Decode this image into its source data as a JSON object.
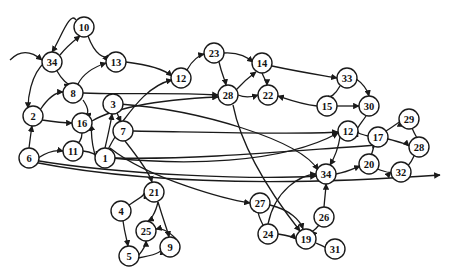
{
  "diagram": {
    "type": "directed-graph",
    "node_radius": 10,
    "colors": {
      "stroke": "#1a1a1a",
      "fill": "#ffffff",
      "background": "#ffffff"
    },
    "nodes": [
      {
        "id": "n10",
        "label": "10",
        "x": 84,
        "y": 27
      },
      {
        "id": "n34a",
        "label": "34",
        "x": 52,
        "y": 62
      },
      {
        "id": "n13",
        "label": "13",
        "x": 116,
        "y": 62
      },
      {
        "id": "n8",
        "label": "8",
        "x": 73,
        "y": 93
      },
      {
        "id": "n2",
        "label": "2",
        "x": 33,
        "y": 116
      },
      {
        "id": "n16",
        "label": "16",
        "x": 82,
        "y": 123
      },
      {
        "id": "n3",
        "label": "3",
        "x": 113,
        "y": 104
      },
      {
        "id": "n7",
        "label": "7",
        "x": 123,
        "y": 131
      },
      {
        "id": "n11",
        "label": "11",
        "x": 73,
        "y": 151
      },
      {
        "id": "n1",
        "label": "1",
        "x": 105,
        "y": 158
      },
      {
        "id": "n6",
        "label": "6",
        "x": 29,
        "y": 158
      },
      {
        "id": "n12a",
        "label": "12",
        "x": 181,
        "y": 78
      },
      {
        "id": "n23",
        "label": "23",
        "x": 214,
        "y": 53
      },
      {
        "id": "n28a",
        "label": "28",
        "x": 228,
        "y": 95
      },
      {
        "id": "n14",
        "label": "14",
        "x": 262,
        "y": 63
      },
      {
        "id": "n22",
        "label": "22",
        "x": 268,
        "y": 95
      },
      {
        "id": "n33",
        "label": "33",
        "x": 347,
        "y": 78
      },
      {
        "id": "n15",
        "label": "15",
        "x": 327,
        "y": 106
      },
      {
        "id": "n30",
        "label": "30",
        "x": 369,
        "y": 106
      },
      {
        "id": "n12b",
        "label": "12",
        "x": 348,
        "y": 131
      },
      {
        "id": "n17",
        "label": "17",
        "x": 378,
        "y": 137
      },
      {
        "id": "n29",
        "label": "29",
        "x": 409,
        "y": 119
      },
      {
        "id": "n28b",
        "label": "28",
        "x": 419,
        "y": 147
      },
      {
        "id": "n20",
        "label": "20",
        "x": 369,
        "y": 164
      },
      {
        "id": "n32",
        "label": "32",
        "x": 401,
        "y": 172
      },
      {
        "id": "n34b",
        "label": "34",
        "x": 326,
        "y": 174
      },
      {
        "id": "n21",
        "label": "21",
        "x": 154,
        "y": 192
      },
      {
        "id": "n4",
        "label": "4",
        "x": 121,
        "y": 211
      },
      {
        "id": "n25",
        "label": "25",
        "x": 146,
        "y": 231
      },
      {
        "id": "n9",
        "label": "9",
        "x": 170,
        "y": 247
      },
      {
        "id": "n5",
        "label": "5",
        "x": 129,
        "y": 256
      },
      {
        "id": "n27",
        "label": "27",
        "x": 260,
        "y": 203
      },
      {
        "id": "n24",
        "label": "24",
        "x": 268,
        "y": 234
      },
      {
        "id": "n19",
        "label": "19",
        "x": 306,
        "y": 239
      },
      {
        "id": "n26",
        "label": "26",
        "x": 324,
        "y": 217
      },
      {
        "id": "n31",
        "label": "31",
        "x": 335,
        "y": 249
      }
    ],
    "edges": [
      {
        "d": "M76,20 C70,10 60,40 52,52"
      },
      {
        "d": "M60,55 C68,45 75,40 80,36"
      },
      {
        "d": "M88,36 C95,55 105,60 108,55"
      },
      {
        "d": "M57,71 C62,80 68,85 70,84"
      },
      {
        "d": "M45,62 C30,75 28,100 28,108"
      },
      {
        "d": "M40,110 C50,95 58,92 63,92"
      },
      {
        "d": "M42,120 C55,122 65,123 72,123"
      },
      {
        "d": "M29,148 C30,140 31,132 32,126"
      },
      {
        "d": "M38,158 C50,150 58,150 63,151"
      },
      {
        "d": "M83,93 C120,95 160,92 218,95"
      },
      {
        "d": "M78,84 C85,70 100,65 106,63"
      },
      {
        "d": "M126,62 C150,65 165,70 172,76"
      },
      {
        "d": "M83,100 C90,110 88,115 85,114"
      },
      {
        "d": "M82,133 C82,140 78,145 76,142"
      },
      {
        "d": "M83,151 C92,152 97,155 96,157"
      },
      {
        "d": "M96,158 C90,140 92,130 91,125"
      },
      {
        "d": "M105,148 C108,135 111,122 112,114"
      },
      {
        "d": "M115,137 C110,145 108,150 108,149"
      },
      {
        "d": "M117,113 C120,120 121,122 121,122"
      },
      {
        "d": "M123,121 C135,105 150,85 172,80"
      },
      {
        "d": "M92,121 C110,110 150,100 218,97"
      },
      {
        "d": "M187,70 C192,60 200,55 204,54"
      },
      {
        "d": "M219,62 C222,75 225,80 226,85"
      },
      {
        "d": "M224,53 C240,52 248,58 253,62"
      },
      {
        "d": "M238,95 C245,98 252,97 258,95"
      },
      {
        "d": "M236,90 C245,80 252,75 256,72"
      },
      {
        "d": "M272,66 C300,72 320,75 337,78"
      },
      {
        "d": "M262,73 C265,80 267,83 267,85"
      },
      {
        "d": "M317,106 C300,104 290,100 278,96"
      },
      {
        "d": "M337,106 C348,106 355,106 359,106"
      },
      {
        "d": "M355,78 C365,85 368,92 369,96"
      },
      {
        "d": "M340,86 C335,95 330,98 328,96"
      },
      {
        "d": "M366,116 C360,125 355,130 358,131"
      },
      {
        "d": "M368,136 C360,134 357,133 358,131"
      },
      {
        "d": "M386,131 C395,125 400,122 400,121"
      },
      {
        "d": "M412,128 C415,135 417,138 417,137"
      },
      {
        "d": "M388,139 C400,142 408,145 409,146"
      },
      {
        "d": "M414,156 C410,165 406,168 406,165"
      },
      {
        "d": "M374,145 C372,155 370,158 370,154"
      },
      {
        "d": "M375,168 C385,172 390,173 391,172"
      },
      {
        "d": "M340,137 C338,150 333,160 330,165"
      },
      {
        "d": "M336,174 C348,172 355,168 360,166"
      },
      {
        "d": "M324,207 C325,195 326,188 326,184"
      },
      {
        "d": "M319,225 C315,230 312,232 311,231"
      },
      {
        "d": "M316,243 C322,246 326,247 325,248"
      },
      {
        "d": "M278,234 C290,236 295,238 296,239"
      },
      {
        "d": "M263,225 C258,215 258,212 259,213"
      },
      {
        "d": "M270,205 C290,210 300,220 303,229"
      },
      {
        "d": "M268,224 C275,190 300,175 316,174"
      },
      {
        "d": "M33,160 C120,175 260,180 316,176"
      },
      {
        "d": "M33,162 C150,185 300,185 440,175"
      },
      {
        "d": "M125,141 C140,160 150,175 152,182"
      },
      {
        "d": "M129,205 C140,198 145,195 144,193"
      },
      {
        "d": "M158,202 C155,215 150,220 148,221"
      },
      {
        "d": "M158,202 C165,225 168,232 169,237"
      },
      {
        "d": "M123,221 C125,235 127,240 128,246"
      },
      {
        "d": "M138,256 C145,248 146,243 146,241"
      },
      {
        "d": "M138,258 C155,255 162,252 161,249"
      },
      {
        "d": "M176,239 C168,230 160,228 156,229"
      },
      {
        "d": "M112,158 C180,165 280,165 338,133"
      },
      {
        "d": "M133,131 C200,132 300,135 338,132"
      },
      {
        "d": "M115,158 C200,160 300,150 378,145"
      },
      {
        "d": "M110,148 C150,180 230,200 250,203"
      },
      {
        "d": "M120,104 C200,110 300,140 318,170"
      },
      {
        "d": "M233,105 C240,140 260,180 300,231"
      },
      {
        "d": "M10,60 C20,50 30,50 42,60"
      }
    ]
  }
}
